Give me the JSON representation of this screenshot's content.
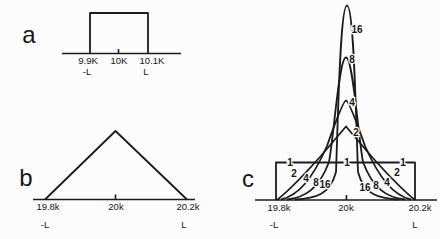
{
  "colors": {
    "ink": "#1b1b1b",
    "background": "#fcfcfc"
  },
  "panels": {
    "a": {
      "letter": "a",
      "ticks": {
        "left": "9.9K",
        "center": "10K",
        "right": "10.1K"
      },
      "limits": {
        "left": "-L",
        "right": "L"
      },
      "paths": {
        "axis": "M62,53.5 H181",
        "center_tick": "M118.5,49 V53.5",
        "pulse": "M90,53.5 V13 H148 V53.5"
      }
    },
    "b": {
      "letter": "b",
      "ticks": {
        "left": "19.8k",
        "center": "20k",
        "right": "20.2k"
      },
      "limits": {
        "left": "-L",
        "right": "L"
      },
      "paths": {
        "axis": "M33,199.5 H195",
        "center_tick": "M115.5,194.5 V199.5",
        "triangle": "M45,199.5 L115.5,131 L187,199.5"
      }
    },
    "c": {
      "letter": "c",
      "ticks": {
        "left": "19.8k",
        "center": "20k",
        "right": "20.2k"
      },
      "limits": {
        "left": "-L",
        "right": "L"
      },
      "curve_labels": {
        "top_16": "16",
        "top_8": "8",
        "top_4": "4",
        "top_2": "2",
        "line1_left": "1",
        "line1_center": "1",
        "line1_right": "1",
        "bottom_left_2": "2",
        "bottom_left_4": "4",
        "bottom_left_8": "8",
        "bottom_left_16": "16",
        "bottom_right_16": "16",
        "bottom_right_8": "8",
        "bottom_right_4": "4",
        "bottom_right_2": "2"
      },
      "paths": {
        "axis": "M255,200 H437",
        "center_tick": "M346.5,195 V200",
        "rect_n1": "M276,200 V162.5 H415 V200",
        "curve_n2": "M277,200 C287,192 303,176 320,157 L346,126.5 L372,157 C389,176 405,192 415,200",
        "curve_n4": "M281,199.5 C298,195.5 312,180 327,146 Q343,100.5 346,100.5 Q349,100.5 365,146 C380,180 394,195.5 411,199.5",
        "curve_n8": "M287,199.5 C305,197.5 319,189 329,162 C334,135 339,57.5 346,57.5 C353,57.5 358,135 363,162 C373,189 387,197.5 405,199.5",
        "curve_n16": "M295,199.5 C315,198.5 330,195 336,172 C338,120 340,5.5 347,5.5 C354,5.5 356,120 358,172 C364,195 379,198.5 399,199.5"
      }
    }
  },
  "chart_data": [
    {
      "type": "line",
      "panel": "a",
      "shape": "rectangular-pulse",
      "x_ticks": [
        "9.9K",
        "10K",
        "10.1K"
      ],
      "x_limit_labels": [
        "-L",
        "L"
      ],
      "center_x": "10K",
      "series": [
        {
          "name": "rectangular window",
          "x": [
            "9.9K",
            "9.9K",
            "10.1K",
            "10.1K"
          ],
          "y": [
            0,
            1,
            1,
            0
          ]
        }
      ],
      "grid": false,
      "legend": false
    },
    {
      "type": "line",
      "panel": "b",
      "shape": "triangular-pulse",
      "x_ticks": [
        "19.8k",
        "20k",
        "20.2k"
      ],
      "x_limit_labels": [
        "-L",
        "L"
      ],
      "center_x": "20k",
      "series": [
        {
          "name": "triangular window",
          "x": [
            "19.8k",
            "20k",
            "20.2k"
          ],
          "y": [
            0,
            1,
            0
          ]
        }
      ],
      "grid": false,
      "legend": false
    },
    {
      "type": "line",
      "panel": "c",
      "shape": "peak-family",
      "x_ticks": [
        "19.8k",
        "20k",
        "20.2k"
      ],
      "x_limit_labels": [
        "-L",
        "L"
      ],
      "center_x": "20k",
      "curve_orders": [
        1,
        2,
        4,
        8,
        16
      ],
      "relative_peak_heights": [
        1.0,
        1.96,
        2.65,
        3.8,
        5.2
      ],
      "note": "Curve 1 is flat-topped between -L and L; higher orders are progressively taller and narrower peaks centered at 20k, each labeled on its apex and on both tails",
      "grid": false,
      "legend": false
    }
  ]
}
